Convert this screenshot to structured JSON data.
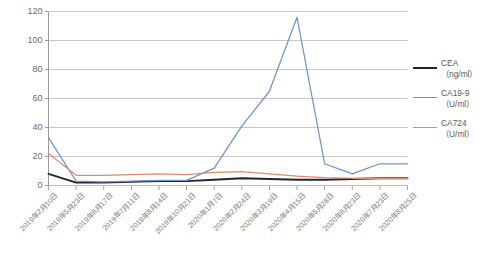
{
  "chart_data": {
    "type": "line",
    "title": "",
    "xlabel": "",
    "ylabel": "",
    "ylim": [
      0,
      120
    ],
    "ytick_step": 20,
    "yticks": [
      "0",
      "20",
      "40",
      "60",
      "80",
      "100",
      "120"
    ],
    "grid": true,
    "legend_position": "right",
    "categories": [
      "2019年2月10日",
      "2019年5月23日",
      "2019年6月17日",
      "2019年7月11日",
      "2019年8月14日",
      "2019年10月21日",
      "2020年1月7日",
      "2020年2月24日",
      "2020年3月19日",
      "2020年4月15日",
      "2020年5月28日",
      "2020年6月23日",
      "2020年7月23日",
      "2020年8月25日"
    ],
    "series": [
      {
        "name": "CEA",
        "unit": "（ng/ml）",
        "color": "#262626",
        "values": [
          8,
          2,
          2,
          2.5,
          3,
          3,
          4,
          5,
          4.5,
          4,
          4,
          4.5,
          5,
          5
        ]
      },
      {
        "name": "CA19-9",
        "unit": "（U/ml）",
        "color": "#6e93cf",
        "values": [
          33,
          3,
          2.5,
          3,
          3.5,
          3.5,
          12,
          41,
          65,
          116,
          15,
          8,
          15,
          15
        ]
      },
      {
        "name": "CA724",
        "unit": "（U/ml）",
        "color": "#e08a6e",
        "values": [
          22,
          7,
          7,
          7.5,
          8,
          7.5,
          9,
          9.5,
          8,
          6.5,
          5.5,
          5,
          5,
          5
        ]
      }
    ]
  },
  "legend": {
    "items": [
      {
        "label": "CEA",
        "sub": "（ng/ml）",
        "color": "#262626"
      },
      {
        "label": "CA19-9",
        "sub": "（U/ml）",
        "color": "#6e93cf"
      },
      {
        "label": "CA724",
        "sub": "（U/ml）",
        "color": "#e08a6e"
      }
    ]
  }
}
